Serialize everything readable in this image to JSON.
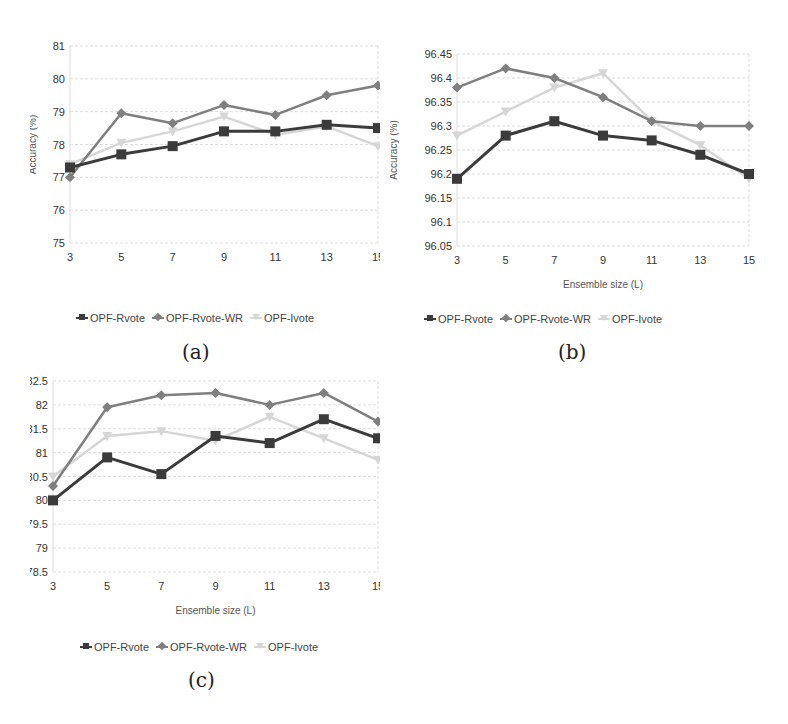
{
  "colors": {
    "OPF-Rvote": "#3b3b3b",
    "OPF-Rvote-WR": "#7f7f7f",
    "OPF-Ivote": "#d6d6d6",
    "grid": "#dddddd"
  },
  "chart_data": [
    {
      "id": "a",
      "type": "line",
      "caption": "(a)",
      "title": "",
      "xlabel": "Ensemble size (L)",
      "ylabel": "Accuracy (%)",
      "x": [
        3,
        5,
        7,
        9,
        11,
        13,
        15
      ],
      "ylim": [
        75,
        81
      ],
      "yticks": [
        75,
        76,
        77,
        78,
        79,
        80,
        81
      ],
      "grid": true,
      "legend_position": "bottom",
      "series": [
        {
          "name": "OPF-Rvote",
          "marker": "square",
          "values": [
            77.3,
            77.7,
            77.95,
            78.4,
            78.4,
            78.6,
            78.5
          ]
        },
        {
          "name": "OPF-Rvote-WR",
          "marker": "diamond",
          "values": [
            77.0,
            78.95,
            78.65,
            79.2,
            78.9,
            79.5,
            79.8
          ]
        },
        {
          "name": "OPF-Ivote",
          "marker": "triangle",
          "values": [
            77.4,
            78.05,
            78.4,
            78.85,
            78.3,
            78.55,
            77.95
          ]
        }
      ]
    },
    {
      "id": "b",
      "type": "line",
      "caption": "(b)",
      "title": "",
      "xlabel": "Ensemble size (L)",
      "ylabel": "Accuracy (%)",
      "x": [
        3,
        5,
        7,
        9,
        11,
        13,
        15
      ],
      "ylim": [
        96.05,
        96.45
      ],
      "yticks": [
        96.05,
        96.1,
        96.15,
        96.2,
        96.25,
        96.3,
        96.35,
        96.4,
        96.45
      ],
      "grid": true,
      "legend_position": "bottom",
      "series": [
        {
          "name": "OPF-Rvote",
          "marker": "square",
          "values": [
            96.19,
            96.28,
            96.31,
            96.28,
            96.27,
            96.24,
            96.2
          ]
        },
        {
          "name": "OPF-Rvote-WR",
          "marker": "diamond",
          "values": [
            96.38,
            96.42,
            96.4,
            96.36,
            96.31,
            96.3,
            96.3
          ]
        },
        {
          "name": "OPF-Ivote",
          "marker": "triangle",
          "values": [
            96.28,
            96.33,
            96.38,
            96.41,
            96.31,
            96.26,
            96.19
          ]
        }
      ]
    },
    {
      "id": "c",
      "type": "line",
      "caption": "(c)",
      "title": "",
      "xlabel": "Ensemble size (L)",
      "ylabel": "Accuracy (%)",
      "x": [
        3,
        5,
        7,
        9,
        11,
        13,
        15
      ],
      "ylim": [
        78.5,
        82.5
      ],
      "yticks": [
        78.5,
        79,
        79.5,
        80,
        80.5,
        81,
        81.5,
        82,
        82.5
      ],
      "grid": true,
      "legend_position": "bottom",
      "series": [
        {
          "name": "OPF-Rvote",
          "marker": "square",
          "values": [
            80.0,
            80.9,
            80.55,
            81.35,
            81.2,
            81.7,
            81.3
          ]
        },
        {
          "name": "OPF-Rvote-WR",
          "marker": "diamond",
          "values": [
            80.3,
            81.95,
            82.2,
            82.25,
            82.0,
            82.25,
            81.65
          ]
        },
        {
          "name": "OPF-Ivote",
          "marker": "triangle",
          "values": [
            80.5,
            81.35,
            81.45,
            81.25,
            81.75,
            81.3,
            80.85
          ]
        }
      ]
    }
  ]
}
